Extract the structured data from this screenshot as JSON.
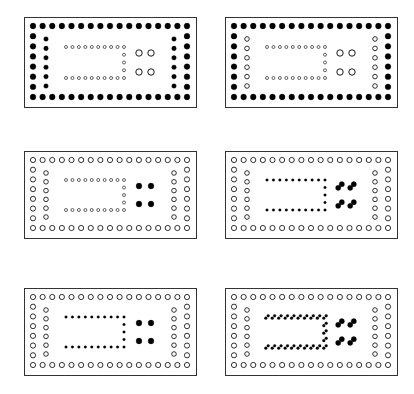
{
  "figure": {
    "colors": {
      "ink": "#000000",
      "paper": "#ffffff",
      "border": "#333333"
    },
    "panels": [
      {
        "id": "panel-1",
        "x": 24,
        "y": 17,
        "w": 172,
        "h": 90,
        "outer_ring": "filled",
        "inner_ring": "filled",
        "inner_rect": "open",
        "inner_rect_style": "single",
        "center": "open",
        "center_style": "straight"
      },
      {
        "id": "panel-2",
        "x": 225,
        "y": 17,
        "w": 172,
        "h": 90,
        "outer_ring": "filled",
        "inner_ring": "open",
        "inner_rect": "open",
        "inner_rect_style": "single",
        "center": "open",
        "center_style": "straight"
      },
      {
        "id": "panel-3",
        "x": 24,
        "y": 151,
        "w": 172,
        "h": 87,
        "outer_ring": "open",
        "inner_ring": "open",
        "inner_rect": "open",
        "inner_rect_style": "single",
        "center": "filled",
        "center_style": "straight"
      },
      {
        "id": "panel-4",
        "x": 225,
        "y": 151,
        "w": 172,
        "h": 87,
        "outer_ring": "open",
        "inner_ring": "open",
        "inner_rect": "filled",
        "inner_rect_style": "single",
        "center": "filled",
        "center_style": "diagonal"
      },
      {
        "id": "panel-5",
        "x": 24,
        "y": 288,
        "w": 172,
        "h": 87,
        "outer_ring": "open",
        "inner_ring": "open",
        "inner_rect": "filled",
        "inner_rect_style": "single",
        "center": "filled",
        "center_style": "straight"
      },
      {
        "id": "panel-6",
        "x": 225,
        "y": 288,
        "w": 172,
        "h": 87,
        "outer_ring": "open",
        "inner_ring": "open",
        "inner_rect": "filled",
        "inner_rect_style": "doubled",
        "center": "filled",
        "center_style": "diagonal"
      }
    ],
    "layout": {
      "outer_top_count": 17,
      "outer_side_count": 8,
      "inner_side_count": 6,
      "inner_rect_top_count": 10,
      "inner_rect_right_count": 5
    }
  }
}
